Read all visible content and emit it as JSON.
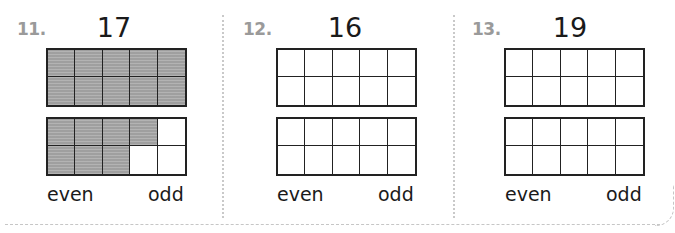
{
  "problems": [
    {
      "number": "11.",
      "target": "17",
      "frames": [
        {
          "filled": [
            true,
            true,
            true,
            true,
            true,
            true,
            true,
            true,
            true,
            true
          ]
        },
        {
          "filled": [
            true,
            true,
            true,
            true,
            false,
            true,
            true,
            true,
            false,
            false
          ]
        }
      ],
      "choices": [
        "even",
        "odd"
      ]
    },
    {
      "number": "12.",
      "target": "16",
      "frames": [
        {
          "filled": [
            false,
            false,
            false,
            false,
            false,
            false,
            false,
            false,
            false,
            false
          ]
        },
        {
          "filled": [
            false,
            false,
            false,
            false,
            false,
            false,
            false,
            false,
            false,
            false
          ]
        }
      ],
      "choices": [
        "even",
        "odd"
      ]
    },
    {
      "number": "13.",
      "target": "19",
      "frames": [
        {
          "filled": [
            false,
            false,
            false,
            false,
            false,
            false,
            false,
            false,
            false,
            false
          ]
        },
        {
          "filled": [
            false,
            false,
            false,
            false,
            false,
            false,
            false,
            false,
            false,
            false
          ]
        }
      ],
      "choices": [
        "even",
        "odd"
      ]
    }
  ],
  "colors": {
    "number_label": "#9a9a9a",
    "filled_cell": "#a9a9a9",
    "grid_line": "#222222",
    "divider": "#c9c9c9"
  }
}
